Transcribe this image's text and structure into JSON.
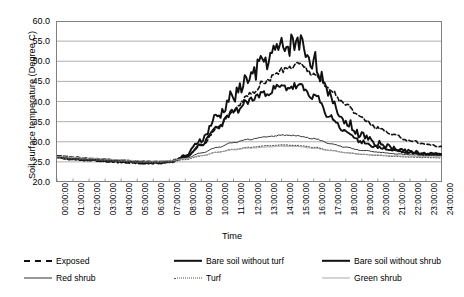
{
  "chart_data": {
    "type": "line",
    "title": "",
    "xlabel": "Time",
    "ylabel": "Soil surface temperature (Degree C)",
    "ylim": [
      20.0,
      60.0
    ],
    "ytick_labels": [
      "60.0",
      "55.0",
      "50.0",
      "45.0",
      "40.0",
      "35.0",
      "30.0",
      "25.0",
      "20.0"
    ],
    "ytick_values": [
      60,
      55,
      50,
      45,
      40,
      35,
      30,
      25,
      20
    ],
    "grid": true,
    "legend_position": "bottom",
    "x": [
      "00:00:00",
      "01:00:00",
      "02:00:00",
      "03:00:00",
      "04:00:00",
      "05:00:00",
      "06:00:00",
      "07:00:00",
      "08:00:00",
      "09:00:00",
      "10:00:00",
      "11:00:00",
      "12:00:00",
      "13:00:00",
      "14:00:00",
      "15:00:00",
      "16:00:00",
      "17:00:00",
      "18:00:00",
      "19:00:00",
      "20:00:00",
      "21:00:00",
      "22:00:00",
      "23:00:00",
      "24:00:00"
    ],
    "series": [
      {
        "name": "Exposed",
        "style": "dashed",
        "color": "#111111",
        "width": 1.6,
        "values": [
          26.6,
          26.2,
          25.9,
          25.6,
          25.4,
          25.2,
          25.1,
          25.2,
          26.2,
          29.0,
          33.4,
          37.8,
          41.6,
          45.0,
          47.6,
          49.4,
          47.2,
          43.0,
          39.2,
          35.8,
          33.4,
          31.6,
          30.3,
          29.4,
          28.8
        ]
      },
      {
        "name": "Bare soil without turf",
        "style": "solid-thick",
        "color": "#111111",
        "width": 1.9,
        "values": [
          26.3,
          25.9,
          25.6,
          25.3,
          25.1,
          24.9,
          24.8,
          25.0,
          26.5,
          30.5,
          36.2,
          41.5,
          46.0,
          50.5,
          53.5,
          55.0,
          50.5,
          41.0,
          35.0,
          31.6,
          29.6,
          28.4,
          27.6,
          27.1,
          26.8
        ]
      },
      {
        "name": "Bare soil without shrub",
        "style": "solid-thick",
        "color": "#111111",
        "width": 1.9,
        "values": [
          26.1,
          25.7,
          25.4,
          25.2,
          25.0,
          24.8,
          24.7,
          24.9,
          26.2,
          29.4,
          33.6,
          37.4,
          40.2,
          42.4,
          43.4,
          43.6,
          41.5,
          36.2,
          32.4,
          30.0,
          28.6,
          27.8,
          27.2,
          26.9,
          26.7
        ]
      },
      {
        "name": "Red shrub",
        "style": "solid-thin",
        "color": "#333333",
        "width": 1.0,
        "values": [
          26.2,
          25.9,
          25.6,
          25.4,
          25.2,
          25.0,
          24.9,
          25.1,
          25.9,
          27.2,
          28.6,
          29.8,
          30.6,
          31.2,
          31.6,
          31.5,
          30.8,
          29.6,
          28.6,
          27.9,
          27.4,
          27.0,
          26.8,
          26.6,
          26.5
        ]
      },
      {
        "name": "Turf",
        "style": "dotted",
        "color": "#555555",
        "width": 1.2,
        "values": [
          26.0,
          25.7,
          25.5,
          25.3,
          25.1,
          24.9,
          24.8,
          25.0,
          25.6,
          26.5,
          27.4,
          28.1,
          28.6,
          29.0,
          29.2,
          29.1,
          28.6,
          27.9,
          27.3,
          26.9,
          26.6,
          26.4,
          26.2,
          26.1,
          26.0
        ]
      },
      {
        "name": "Green shrub",
        "style": "solid-light",
        "color": "#aaaaaa",
        "width": 1.0,
        "values": [
          26.4,
          26.1,
          25.9,
          25.7,
          25.5,
          25.3,
          25.2,
          25.3,
          25.8,
          26.6,
          27.4,
          28.0,
          28.4,
          28.7,
          28.9,
          28.8,
          28.4,
          27.8,
          27.3,
          26.9,
          26.7,
          26.5,
          26.4,
          26.3,
          26.2
        ]
      }
    ]
  },
  "axes": {
    "ylabel": "Soil surface temperature (Degree C)",
    "xlabel": "Time"
  },
  "legend": {
    "items": [
      {
        "label": "Exposed",
        "swatch": "sw-dash"
      },
      {
        "label": "Bare soil without turf",
        "swatch": "sw-thick"
      },
      {
        "label": "Bare soil without shrub",
        "swatch": "sw-thick"
      },
      {
        "label": "Red shrub",
        "swatch": "sw-thin"
      },
      {
        "label": "Turf",
        "swatch": "sw-dot"
      },
      {
        "label": "Green shrub",
        "swatch": "sw-light"
      }
    ]
  }
}
